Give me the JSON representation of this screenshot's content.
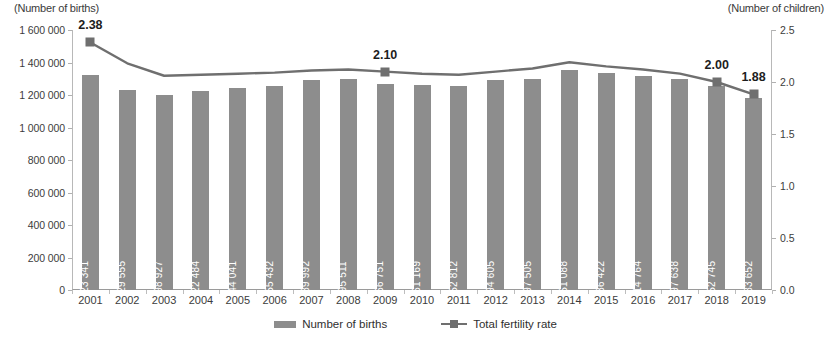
{
  "chart_data": {
    "type": "bar",
    "title": "",
    "subtitle": "",
    "xlabel": "",
    "ylabel": "(Number of births)",
    "y2label": "(Number of children)",
    "categories": [
      "2001",
      "2002",
      "2003",
      "2004",
      "2005",
      "2006",
      "2007",
      "2008",
      "2009",
      "2010",
      "2011",
      "2012",
      "2013",
      "2014",
      "2015",
      "2016",
      "2017",
      "2018",
      "2019"
    ],
    "ylim": [
      0,
      1600000
    ],
    "y2lim": [
      0.0,
      2.5
    ],
    "yticks": [
      0,
      200000,
      400000,
      600000,
      800000,
      1000000,
      1200000,
      1400000,
      1600000
    ],
    "ytick_labels": [
      "0",
      "200 000",
      "400 000",
      "600 000",
      "800 000",
      "1 000 000",
      "1 200 000",
      "1 400 000",
      "1 600 000"
    ],
    "y2ticks": [
      0.0,
      0.5,
      1.0,
      1.5,
      2.0,
      2.5
    ],
    "y2tick_labels": [
      "0.0",
      "0.5",
      "1.0",
      "1.5",
      "2.0",
      "2.5"
    ],
    "grid": false,
    "legend_position": "bottom",
    "series": [
      {
        "name": "Number of births",
        "type": "bar",
        "axis": "left",
        "color": "#8d8d8d",
        "values": [
          1323341,
          1229555,
          1198927,
          1222484,
          1244041,
          1255432,
          1289992,
          1295511,
          1266751,
          1261169,
          1252812,
          1294605,
          1297505,
          1351088,
          1336422,
          1314764,
          1297638,
          1252745,
          1183652
        ],
        "value_labels": [
          "1 323 341",
          "1 229 555",
          "1 198 927",
          "1 222 484",
          "1 244 041",
          "1 255 432",
          "1 289 992",
          "1 295 511",
          "1 266 751",
          "1 261 169",
          "1 252 812",
          "1 294 605",
          "1 297 505",
          "1 351 088",
          "1 336 422",
          "1 314 764",
          "1 297 638",
          "1 252 745",
          "1 183 652"
        ]
      },
      {
        "name": "Total fertility rate",
        "type": "line",
        "axis": "right",
        "color": "#6f6f6f",
        "values": [
          2.38,
          2.18,
          2.06,
          2.07,
          2.08,
          2.09,
          2.11,
          2.12,
          2.1,
          2.08,
          2.07,
          2.1,
          2.13,
          2.19,
          2.15,
          2.12,
          2.08,
          2.0,
          1.88
        ],
        "labeled_points": [
          {
            "category": "2001",
            "value": 2.38,
            "label": "2.38"
          },
          {
            "category": "2009",
            "value": 2.1,
            "label": "2.10"
          },
          {
            "category": "2018",
            "value": 2.0,
            "label": "2.00"
          },
          {
            "category": "2019",
            "value": 1.88,
            "label": "1.88"
          }
        ]
      }
    ]
  },
  "legend": {
    "items": [
      {
        "label": "Number of births",
        "marker": "bar-swatch"
      },
      {
        "label": "Total fertility rate",
        "marker": "line-marker-swatch"
      }
    ]
  }
}
